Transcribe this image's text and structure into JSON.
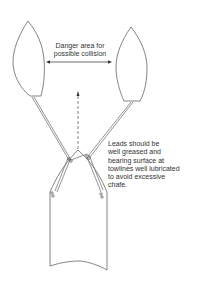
{
  "diagram": {
    "labels": {
      "danger_area": [
        "Danger area for",
        "possible collision"
      ],
      "leads_note": [
        "Leads should be",
        "well greased and",
        "bearing surface at",
        "towlines well lubricated",
        "to avoid excessive",
        "chafe."
      ]
    },
    "elements": {
      "tugs": [
        "port tug",
        "starboard tug"
      ],
      "ship": "towed vessel bow",
      "arrow_double": "danger area span",
      "arrow_dashed": "direction of tow"
    },
    "colors": {
      "line": "#555555",
      "text": "#333333",
      "background": "#ffffff"
    }
  }
}
